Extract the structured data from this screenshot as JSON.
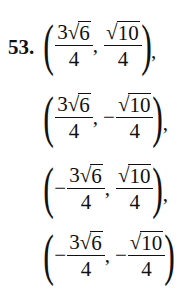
{
  "problem": {
    "number": "53.",
    "points": [
      {
        "x": {
          "sign": "",
          "coef": "3",
          "radicand": "6",
          "den": "4"
        },
        "y": {
          "sign": "",
          "coef": "",
          "radicand": "10",
          "den": "4"
        },
        "trailing": ","
      },
      {
        "x": {
          "sign": "",
          "coef": "3",
          "radicand": "6",
          "den": "4"
        },
        "y": {
          "sign": "−",
          "coef": "",
          "radicand": "10",
          "den": "4"
        },
        "trailing": ","
      },
      {
        "x": {
          "sign": "−",
          "coef": "3",
          "radicand": "6",
          "den": "4"
        },
        "y": {
          "sign": "",
          "coef": "",
          "radicand": "10",
          "den": "4"
        },
        "trailing": ","
      },
      {
        "x": {
          "sign": "−",
          "coef": "3",
          "radicand": "6",
          "den": "4"
        },
        "y": {
          "sign": "−",
          "coef": "",
          "radicand": "10",
          "den": "4"
        },
        "trailing": ""
      }
    ],
    "symbols": {
      "open": "(",
      "close": ")",
      "radical": "√",
      "separator": ","
    }
  }
}
